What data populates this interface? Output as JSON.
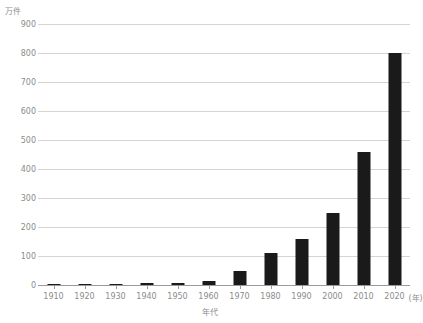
{
  "chart_data": {
    "type": "bar",
    "title": "",
    "subtitle": "",
    "unit_label": "万件",
    "xlabel": "年代",
    "x_axis_suffix": "(年)",
    "ylabel": "",
    "ylim": [
      0,
      900
    ],
    "ytick_step": 100,
    "grid": true,
    "legend": "none",
    "bar_color": "#1a1a1a",
    "gridline_color": "#d4d4d4",
    "tick_text_color": "#8c8c8c",
    "categories": [
      "1910",
      "1920",
      "1930",
      "1940",
      "1950",
      "1960",
      "1970",
      "1980",
      "1990",
      "2000",
      "2010",
      "2020"
    ],
    "values": [
      3,
      3,
      4,
      7,
      7,
      15,
      50,
      110,
      160,
      250,
      460,
      800
    ],
    "yticks": [
      "0",
      "100",
      "200",
      "300",
      "400",
      "500",
      "600",
      "700",
      "800",
      "900"
    ]
  },
  "axis": {
    "unit": "万件",
    "x_title": "年代",
    "x_suffix": "(年)"
  }
}
